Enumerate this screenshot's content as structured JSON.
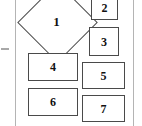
{
  "diagram": {
    "type": "flowchart-fragment",
    "background_color": "#ffffff",
    "stroke_color": "#4a4a4a",
    "rule_color": "#b4b4b4",
    "label_color": "#111111",
    "left_rule": {
      "x": 15,
      "y": 0,
      "height": 126
    },
    "right_rule": {
      "x": 133,
      "y": 0,
      "height": 126
    },
    "left_tick": {
      "x": 1,
      "y": 48,
      "width": 8
    },
    "nodes": [
      {
        "id": "node-1",
        "label": "1",
        "shape": "diamond",
        "x": 29,
        "y": -6,
        "width": 55,
        "height": 55,
        "font_size": 13
      },
      {
        "id": "node-2",
        "label": "2",
        "shape": "rect",
        "x": 91,
        "y": -5,
        "width": 27,
        "height": 25,
        "font_size": 12
      },
      {
        "id": "node-3",
        "label": "3",
        "shape": "rect",
        "x": 89,
        "y": 27,
        "width": 30,
        "height": 29,
        "font_size": 12
      },
      {
        "id": "node-4",
        "label": "4",
        "shape": "rect",
        "x": 28,
        "y": 53,
        "width": 50,
        "height": 28,
        "font_size": 12
      },
      {
        "id": "node-5",
        "label": "5",
        "shape": "rect",
        "x": 82,
        "y": 62,
        "width": 43,
        "height": 27,
        "font_size": 12
      },
      {
        "id": "node-6",
        "label": "6",
        "shape": "rect",
        "x": 28,
        "y": 88,
        "width": 50,
        "height": 28,
        "font_size": 12
      },
      {
        "id": "node-7",
        "label": "7",
        "shape": "rect",
        "x": 82,
        "y": 95,
        "width": 43,
        "height": 27,
        "font_size": 12
      }
    ]
  }
}
